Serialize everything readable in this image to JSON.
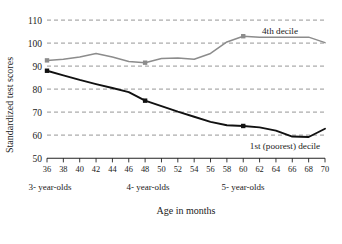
{
  "chart_data": {
    "type": "line",
    "title": "",
    "subtitle": "",
    "xlabel": "Age in months",
    "ylabel": "Standardized test scores",
    "xlim": [
      36,
      70
    ],
    "ylim": [
      50,
      110
    ],
    "grid": "horizontal dashed gridlines at every 10 units from 60 to 110",
    "legend_position": "inline labels at right end of each series",
    "x_ticks": [
      36,
      38,
      40,
      42,
      44,
      46,
      48,
      50,
      52,
      54,
      56,
      58,
      60,
      62,
      64,
      66,
      68,
      70
    ],
    "y_ticks": [
      50,
      60,
      70,
      80,
      90,
      100,
      110
    ],
    "x": [
      36,
      38,
      40,
      42,
      44,
      46,
      48,
      50,
      52,
      54,
      56,
      58,
      60,
      62,
      64,
      66,
      68,
      70
    ],
    "series": [
      {
        "name": "4th decile",
        "color": "#8c8c8c",
        "label_text": "4th decile",
        "values": [
          92.5,
          93.0,
          94.0,
          95.5,
          94.0,
          92.0,
          91.5,
          93.3,
          93.5,
          93.0,
          95.5,
          100.5,
          103.0,
          102.5,
          102.5,
          102.5,
          102.6,
          100.2
        ],
        "markers_at": [
          36,
          48,
          60
        ]
      },
      {
        "name": "1st (poorest) decile",
        "color": "#111111",
        "label_text": "1st (poorest) decile",
        "values": [
          88.0,
          86.0,
          84.0,
          82.2,
          80.5,
          78.7,
          75.0,
          72.6,
          70.2,
          68.0,
          65.8,
          64.3,
          64.0,
          63.4,
          62.0,
          59.4,
          59.2,
          62.8
        ],
        "markers_at": [
          36,
          48,
          60
        ]
      }
    ],
    "annotations": [
      {
        "name": "group-3-year-olds",
        "text": "3- year-olds"
      },
      {
        "name": "group-4-year-olds",
        "text": "4- year-olds"
      },
      {
        "name": "group-5-year-olds",
        "text": "5- year-olds"
      }
    ]
  },
  "axis": {
    "y_title": "Standardized test scores",
    "x_title": "Age in months",
    "y_tick_110": "110",
    "y_tick_100": "100",
    "y_tick_90": "90",
    "y_tick_80": "80",
    "y_tick_70": "70",
    "y_tick_60": "60",
    "y_tick_50": "50",
    "x_tick_36": "36",
    "x_tick_38": "38",
    "x_tick_40": "40",
    "x_tick_42": "42",
    "x_tick_44": "44",
    "x_tick_46": "46",
    "x_tick_48": "48",
    "x_tick_50": "50",
    "x_tick_52": "52",
    "x_tick_54": "54",
    "x_tick_56": "56",
    "x_tick_58": "58",
    "x_tick_60": "60",
    "x_tick_62": "62",
    "x_tick_64": "64",
    "x_tick_66": "66",
    "x_tick_68": "68",
    "x_tick_70": "70"
  },
  "labels": {
    "series_top": "4th decile",
    "series_bottom": "1st (poorest) decile",
    "group_3": "3- year-olds",
    "group_4": "4- year-olds",
    "group_5": "5- year-olds"
  },
  "colors": {
    "line_top": "#8c8c8c",
    "line_bottom": "#111111",
    "grid": "#8a8a8a",
    "axis": "#222222",
    "background": "#ffffff"
  }
}
